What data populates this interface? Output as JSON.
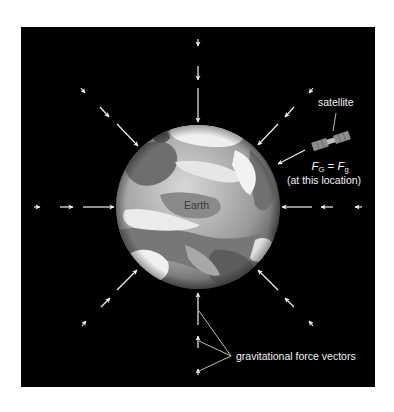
{
  "figure": {
    "background_color": "#000000",
    "page_color": "#ffffff",
    "panel": {
      "x": 21,
      "y": 27,
      "width": 354,
      "height": 360
    }
  },
  "earth": {
    "label": "Earth",
    "center": [
      198,
      207
    ],
    "radius": 82
  },
  "satellite": {
    "label": "satellite",
    "position": [
      331,
      141
    ]
  },
  "formula": {
    "lhs_symbol": "F",
    "lhs_subscript": "G",
    "equals": "=",
    "rhs_symbol": "F",
    "rhs_subscript": "g",
    "note": "(at this location)"
  },
  "vectors_label": "gravitational force vectors",
  "arrow_color": "#f0f0f0",
  "arrow_directions": [
    "top",
    "top-right",
    "right",
    "bottom-right",
    "bottom",
    "bottom-left",
    "left",
    "top-left"
  ],
  "arrows_per_direction": 3
}
